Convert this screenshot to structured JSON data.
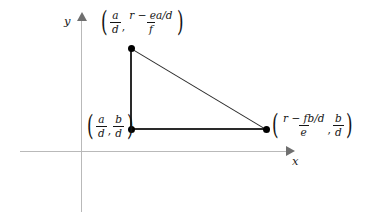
{
  "figure": {
    "type": "geometry-diagram",
    "background_color": "#ffffff",
    "axis_color": "#b9b9b9",
    "line_color": "#2a2a2a",
    "point_color": "#000000"
  },
  "axes": {
    "x_label": "x",
    "y_label": "y",
    "x_arrow": "arrow-right-icon",
    "y_arrow": "arrow-up-icon"
  },
  "vertices": [
    {
      "id": "top",
      "position": {
        "x": 131,
        "y": 48
      },
      "label": {
        "open_paren": "(",
        "close_paren": ")",
        "comma": ",",
        "first": {
          "numerator": "a",
          "denominator": "d"
        },
        "second": {
          "numerator": "r − ea/d",
          "denominator": "f"
        }
      },
      "label_text": "(a/d, (r − ea/d)/f)"
    },
    {
      "id": "bottom-left",
      "position": {
        "x": 131,
        "y": 129
      },
      "label": {
        "open_paren": "(",
        "close_paren": ")",
        "comma": ",",
        "first": {
          "numerator": "a",
          "denominator": "d"
        },
        "second": {
          "numerator": "b",
          "denominator": "d"
        }
      },
      "label_text": "(a/d, b/d)"
    },
    {
      "id": "bottom-right",
      "position": {
        "x": 266,
        "y": 129
      },
      "label": {
        "open_paren": "(",
        "close_paren": ")",
        "comma": ",",
        "first": {
          "numerator": "r − fb/d",
          "denominator": "e"
        },
        "second": {
          "numerator": "b",
          "denominator": "d"
        }
      },
      "label_text": "((r − fb/d)/e, b/d)"
    }
  ],
  "edges": [
    {
      "id": "left-leg",
      "from": "top",
      "to": "bottom-left"
    },
    {
      "id": "bottom-leg",
      "from": "bottom-left",
      "to": "bottom-right"
    },
    {
      "id": "hypotenuse",
      "from": "top",
      "to": "bottom-right"
    }
  ]
}
